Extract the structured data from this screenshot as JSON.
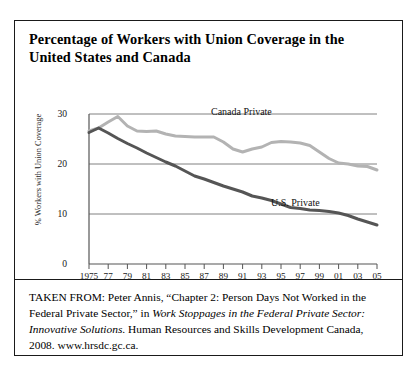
{
  "figure": {
    "title": "Percentage of Workers with Union Coverage in the United States and Canada",
    "source_prefix": "TAKEN FROM: Peter Annis, “Chapter 2: Person Days Not Worked in the Federal Private Sector,” in ",
    "source_italic_1": "Work Stoppages in the Federal Private Sector: Innovative Solutions",
    "source_mid": ". Human Resources and Skills Development Canada, 2008. www.hrsdc.gc.ca.",
    "border_color": "#1a1a1a"
  },
  "chart_data": {
    "type": "line",
    "title": "Percentage of Workers with Union Coverage in the United States and Canada",
    "xlabel": "",
    "ylabel": "% Workers with Union Coverage",
    "xlim": [
      1975,
      2005
    ],
    "ylim": [
      0,
      30
    ],
    "grid": true,
    "gridlines_y": [
      10,
      20,
      30
    ],
    "legend_position": "inline-annotation",
    "x": [
      1975,
      1976,
      1977,
      1978,
      1979,
      1980,
      1981,
      1982,
      1983,
      1984,
      1985,
      1986,
      1987,
      1988,
      1989,
      1990,
      1991,
      1992,
      1993,
      1994,
      1995,
      1996,
      1997,
      1998,
      1999,
      2000,
      2001,
      2002,
      2003,
      2004,
      2005
    ],
    "y_tick_labels": [
      "0",
      "10",
      "20",
      "30"
    ],
    "y_ticks": [
      0,
      10,
      20,
      30
    ],
    "x_tick_labels": [
      "1975",
      "77",
      "79",
      "81",
      "83",
      "85",
      "87",
      "89",
      "91",
      "93",
      "95",
      "97",
      "99",
      "01",
      "03",
      "05"
    ],
    "x_ticks": [
      1975,
      1977,
      1979,
      1981,
      1983,
      1985,
      1987,
      1989,
      1991,
      1993,
      1995,
      1997,
      1999,
      2001,
      2003,
      2005
    ],
    "series": [
      {
        "name": "Canada Private",
        "color": "#b3b3b3",
        "label_x": 1988,
        "label_y": 27.5,
        "values": [
          26.6,
          27.2,
          28.4,
          29.5,
          27.6,
          26.6,
          26.5,
          26.6,
          26.0,
          25.6,
          25.5,
          25.4,
          25.4,
          25.4,
          24.4,
          23.0,
          22.4,
          23.0,
          23.4,
          24.3,
          24.5,
          24.4,
          24.2,
          23.7,
          22.4,
          21.1,
          20.2,
          20.0,
          19.6,
          19.5,
          18.8
        ]
      },
      {
        "name": "U.S. Private",
        "color": "#555555",
        "label_x": 1996,
        "label_y": 13.2,
        "values": [
          26.3,
          27.2,
          26.2,
          25.1,
          24.1,
          23.2,
          22.2,
          21.3,
          20.4,
          19.6,
          18.6,
          17.6,
          17.0,
          16.3,
          15.6,
          15.0,
          14.4,
          13.6,
          13.2,
          12.7,
          12.0,
          11.3,
          11.1,
          10.8,
          10.7,
          10.5,
          10.2,
          9.7,
          9.0,
          8.4,
          7.8
        ]
      }
    ]
  }
}
